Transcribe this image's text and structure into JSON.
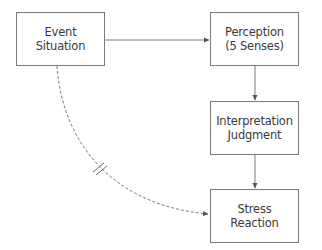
{
  "diagram": {
    "type": "flowchart",
    "nodes": [
      {
        "id": "event",
        "line1": "Event",
        "line2": "Situation",
        "x": 16,
        "y": 12,
        "w": 89,
        "h": 54
      },
      {
        "id": "perception",
        "line1": "Perception",
        "line2": "(5 Senses)",
        "x": 210,
        "y": 12,
        "w": 89,
        "h": 54
      },
      {
        "id": "interpretation",
        "line1": "Interpretation",
        "line2": "Judgment",
        "x": 210,
        "y": 101,
        "w": 89,
        "h": 54
      },
      {
        "id": "stress",
        "line1": "Stress",
        "line2": "Reaction",
        "x": 210,
        "y": 189,
        "w": 89,
        "h": 54
      }
    ],
    "edges": [
      {
        "from": "event",
        "to": "perception",
        "style": "solid",
        "arrow": true
      },
      {
        "from": "perception",
        "to": "interpretation",
        "style": "solid",
        "arrow": true
      },
      {
        "from": "interpretation",
        "to": "stress",
        "style": "solid",
        "arrow": true
      },
      {
        "from": "event",
        "to": "stress",
        "style": "dashed",
        "curved": true,
        "arrow": true,
        "marker": "double-slash-break"
      }
    ],
    "colors": {
      "stroke": "#7a7a7a",
      "text": "#3a3a3a",
      "background": "#ffffff"
    }
  }
}
